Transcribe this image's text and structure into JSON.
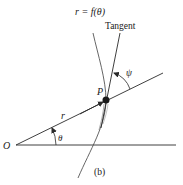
{
  "figure": {
    "caption": "(b)",
    "labels": {
      "curve": "r = f(θ)",
      "tangent": "Tangent",
      "point": "P",
      "radius": "r",
      "theta": "θ",
      "psi": "ψ",
      "origin": "O"
    },
    "colors": {
      "stroke": "#2a2a2a",
      "curve": "#555555",
      "background": "#ffffff"
    }
  }
}
